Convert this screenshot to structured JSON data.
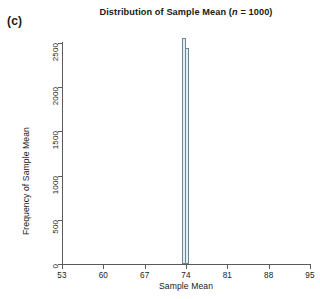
{
  "panel": {
    "label": "(c)"
  },
  "chart_data": {
    "type": "bar",
    "title_plain": "Distribution of Sample Mean (n = 1000)",
    "title_prefix": "Distribution of Sample Mean (",
    "title_italic": "n",
    "title_suffix": " = 1000)",
    "xlabel": "Sample Mean",
    "ylabel": "Frequency of Sample Mean",
    "xlim": [
      53,
      95
    ],
    "ylim": [
      0,
      2500
    ],
    "xticks": [
      53,
      60,
      67,
      74,
      81,
      88,
      95
    ],
    "xtick_labels": [
      "53",
      "60",
      "67",
      "74",
      "81",
      "88",
      "95"
    ],
    "yticks": [
      0,
      500,
      1000,
      1500,
      2000,
      2500
    ],
    "ytick_labels": [
      "0",
      "500",
      "1000",
      "1500",
      "2000",
      "2500"
    ],
    "grid": false,
    "legend": false,
    "bar_fill_color": "#e4f0f5",
    "bar_edge_color": "#6d8590",
    "axis_color": "#5b5b5b",
    "categories": [
      73.6,
      74.2
    ],
    "values": [
      2560,
      2440
    ],
    "bars": [
      {
        "x_center": 73.6,
        "width": 0.55,
        "value": 2560
      },
      {
        "x_center": 74.2,
        "width": 0.55,
        "value": 2440
      }
    ]
  }
}
